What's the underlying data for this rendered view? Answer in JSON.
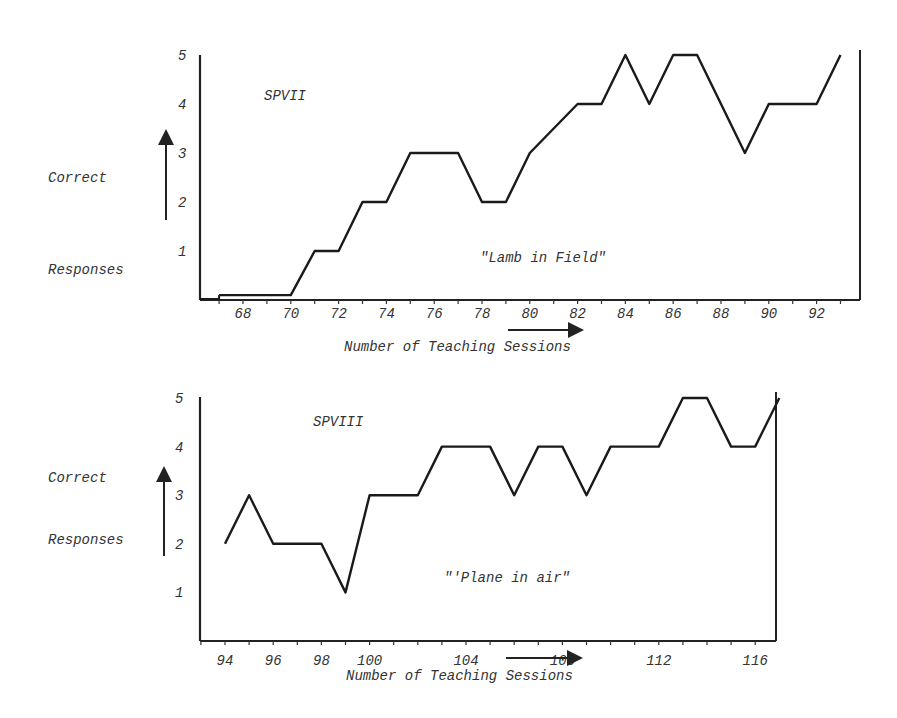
{
  "chart_data": [
    {
      "type": "line",
      "title": "SPVII",
      "annotation": "\"Lamb in Field\"",
      "xlabel": "Number of Teaching Sessions",
      "ylabel_top": "Correct",
      "ylabel_bottom": "Responses",
      "x_ticks": [
        "68",
        "70",
        "72",
        "74",
        "76",
        "78",
        "80",
        "82",
        "84",
        "86",
        "88",
        "90",
        "92"
      ],
      "y_ticks": [
        "1",
        "2",
        "3",
        "4",
        "5"
      ],
      "ylim": [
        0,
        5
      ],
      "xlim": [
        66,
        94
      ],
      "grid": false,
      "x": [
        67,
        70,
        71,
        72,
        73,
        74,
        75,
        77,
        78,
        79,
        80,
        82,
        83,
        84,
        85,
        86,
        87,
        89,
        90,
        92,
        93
      ],
      "values": [
        0.1,
        0.1,
        1,
        1,
        2,
        2,
        3,
        3,
        2,
        2,
        3,
        4,
        4,
        5,
        4,
        5,
        5,
        3,
        4,
        4,
        5
      ]
    },
    {
      "type": "line",
      "title": "SPVIII",
      "annotation": "\"'Plane in air\"",
      "xlabel": "Number of Teaching Sessions",
      "ylabel_top": "Correct",
      "ylabel_bottom": "Responses",
      "x_ticks": [
        "94",
        "96",
        "98",
        "100",
        "104",
        "108",
        "112",
        "116"
      ],
      "y_ticks": [
        "1",
        "2",
        "3",
        "4",
        "5"
      ],
      "ylim": [
        0,
        5
      ],
      "xlim": [
        93,
        118
      ],
      "grid": false,
      "x": [
        94,
        95,
        96,
        98,
        99,
        100,
        102,
        103,
        105,
        106,
        107,
        108,
        109,
        110,
        112,
        113,
        114,
        115,
        116,
        117
      ],
      "values": [
        2,
        3,
        2,
        2,
        1,
        3,
        3,
        4,
        4,
        3,
        4,
        4,
        3,
        4,
        4,
        5,
        5,
        4,
        4,
        5
      ]
    }
  ]
}
